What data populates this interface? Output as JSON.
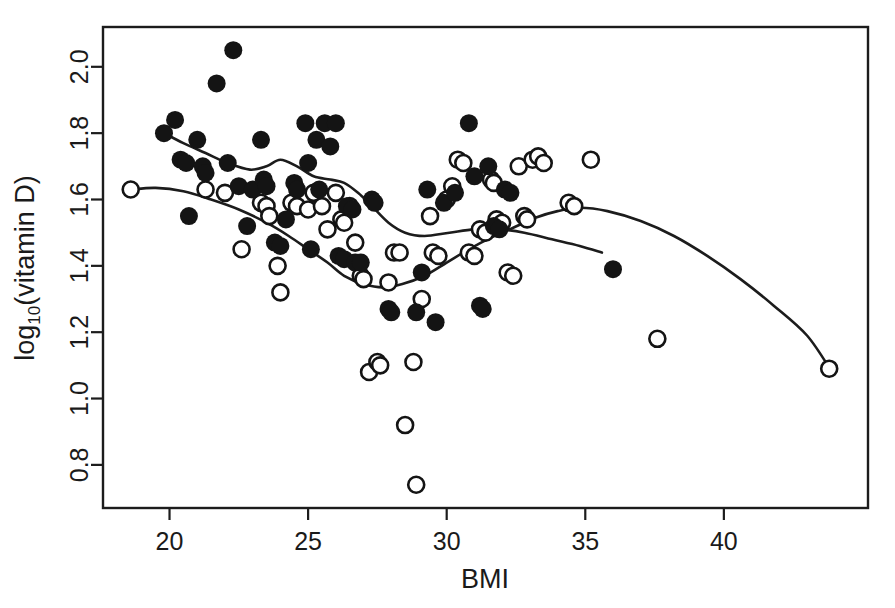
{
  "chart_data": {
    "type": "scatter",
    "title": "",
    "xlabel": "BMI",
    "ylabel": "log10(vitamin D)",
    "ylabel_main": "log",
    "ylabel_sub": "10",
    "ylabel_rest": "(vitamin D)",
    "xlim": [
      17.6,
      45.2
    ],
    "ylim": [
      0.67,
      2.12
    ],
    "xticks": [
      20,
      25,
      30,
      35,
      40
    ],
    "yticks": [
      0.8,
      1.0,
      1.2,
      1.4,
      1.6,
      1.8,
      2.0
    ],
    "xtick_labels": [
      "20",
      "25",
      "30",
      "35",
      "40"
    ],
    "ytick_labels": [
      "0.8",
      "1.0",
      "1.2",
      "1.4",
      "1.6",
      "1.8",
      "2.0"
    ],
    "grid": false,
    "legend": "none",
    "marker_colors": {
      "filled": "#141414",
      "open_stroke": "#141414",
      "open_fill": "#ffffff"
    },
    "axis_color": "#1c1c1c",
    "background": "#ffffff",
    "series": [
      {
        "name": "filled",
        "marker": "filled-circle",
        "points": [
          [
            19.8,
            1.8
          ],
          [
            20.2,
            1.84
          ],
          [
            20.4,
            1.72
          ],
          [
            20.6,
            1.71
          ],
          [
            20.7,
            1.55
          ],
          [
            21.0,
            1.78
          ],
          [
            21.2,
            1.7
          ],
          [
            21.3,
            1.68
          ],
          [
            21.7,
            1.95
          ],
          [
            22.1,
            1.71
          ],
          [
            22.3,
            2.05
          ],
          [
            22.5,
            1.64
          ],
          [
            22.8,
            1.52
          ],
          [
            23.0,
            1.63
          ],
          [
            23.3,
            1.78
          ],
          [
            23.4,
            1.66
          ],
          [
            23.5,
            1.64
          ],
          [
            23.8,
            1.47
          ],
          [
            24.0,
            1.46
          ],
          [
            24.2,
            1.54
          ],
          [
            24.5,
            1.65
          ],
          [
            24.6,
            1.63
          ],
          [
            24.9,
            1.83
          ],
          [
            25.0,
            1.71
          ],
          [
            25.1,
            1.45
          ],
          [
            25.3,
            1.78
          ],
          [
            25.4,
            1.63
          ],
          [
            25.6,
            1.83
          ],
          [
            25.8,
            1.76
          ],
          [
            26.0,
            1.83
          ],
          [
            26.1,
            1.43
          ],
          [
            26.3,
            1.42
          ],
          [
            26.4,
            1.58
          ],
          [
            26.6,
            1.57
          ],
          [
            26.7,
            1.41
          ],
          [
            26.9,
            1.41
          ],
          [
            27.3,
            1.6
          ],
          [
            27.4,
            1.59
          ],
          [
            27.9,
            1.27
          ],
          [
            28.0,
            1.26
          ],
          [
            28.9,
            1.26
          ],
          [
            29.1,
            1.38
          ],
          [
            29.3,
            1.63
          ],
          [
            29.6,
            1.23
          ],
          [
            29.9,
            1.59
          ],
          [
            30.3,
            1.62
          ],
          [
            30.8,
            1.83
          ],
          [
            31.0,
            1.67
          ],
          [
            31.2,
            1.28
          ],
          [
            31.3,
            1.27
          ],
          [
            31.5,
            1.7
          ],
          [
            31.7,
            1.52
          ],
          [
            31.9,
            1.51
          ],
          [
            32.1,
            1.63
          ],
          [
            32.3,
            1.62
          ],
          [
            36.0,
            1.39
          ]
        ]
      },
      {
        "name": "open",
        "marker": "open-circle",
        "points": [
          [
            18.6,
            1.63
          ],
          [
            21.3,
            1.63
          ],
          [
            22.0,
            1.62
          ],
          [
            22.6,
            1.45
          ],
          [
            23.3,
            1.59
          ],
          [
            23.5,
            1.58
          ],
          [
            23.6,
            1.55
          ],
          [
            23.9,
            1.4
          ],
          [
            24.0,
            1.32
          ],
          [
            24.4,
            1.59
          ],
          [
            24.6,
            1.58
          ],
          [
            25.0,
            1.57
          ],
          [
            25.2,
            1.62
          ],
          [
            25.5,
            1.58
          ],
          [
            25.7,
            1.51
          ],
          [
            26.0,
            1.62
          ],
          [
            26.2,
            1.54
          ],
          [
            26.3,
            1.53
          ],
          [
            26.5,
            1.58
          ],
          [
            26.7,
            1.47
          ],
          [
            26.9,
            1.37
          ],
          [
            27.0,
            1.36
          ],
          [
            27.2,
            1.08
          ],
          [
            27.5,
            1.11
          ],
          [
            27.6,
            1.1
          ],
          [
            27.9,
            1.35
          ],
          [
            28.1,
            1.44
          ],
          [
            28.3,
            1.44
          ],
          [
            28.5,
            0.92
          ],
          [
            28.8,
            1.11
          ],
          [
            28.9,
            0.74
          ],
          [
            29.1,
            1.3
          ],
          [
            29.4,
            1.55
          ],
          [
            29.5,
            1.44
          ],
          [
            29.7,
            1.43
          ],
          [
            30.0,
            1.6
          ],
          [
            30.2,
            1.64
          ],
          [
            30.4,
            1.72
          ],
          [
            30.6,
            1.71
          ],
          [
            30.8,
            1.44
          ],
          [
            31.0,
            1.43
          ],
          [
            31.2,
            1.51
          ],
          [
            31.4,
            1.5
          ],
          [
            31.6,
            1.66
          ],
          [
            31.7,
            1.65
          ],
          [
            31.8,
            1.54
          ],
          [
            32.0,
            1.53
          ],
          [
            32.2,
            1.38
          ],
          [
            32.4,
            1.37
          ],
          [
            32.6,
            1.7
          ],
          [
            32.8,
            1.55
          ],
          [
            32.9,
            1.54
          ],
          [
            33.1,
            1.72
          ],
          [
            33.3,
            1.73
          ],
          [
            33.5,
            1.71
          ],
          [
            34.4,
            1.59
          ],
          [
            34.6,
            1.58
          ],
          [
            35.2,
            1.72
          ],
          [
            37.6,
            1.18
          ],
          [
            43.8,
            1.09
          ]
        ]
      }
    ],
    "trend_curves": [
      {
        "name": "filled-loess",
        "description": "Lowess smoother through filled points",
        "path": [
          [
            19.8,
            1.8
          ],
          [
            20.5,
            1.77
          ],
          [
            21.3,
            1.74
          ],
          [
            22.1,
            1.71
          ],
          [
            22.9,
            1.69
          ],
          [
            23.5,
            1.7
          ],
          [
            24.0,
            1.72
          ],
          [
            24.6,
            1.7
          ],
          [
            25.2,
            1.67
          ],
          [
            25.8,
            1.66
          ],
          [
            26.3,
            1.65
          ],
          [
            26.8,
            1.62
          ],
          [
            27.3,
            1.58
          ],
          [
            27.9,
            1.53
          ],
          [
            28.5,
            1.5
          ],
          [
            29.2,
            1.49
          ],
          [
            30.1,
            1.5
          ],
          [
            31.0,
            1.51
          ],
          [
            31.9,
            1.51
          ],
          [
            32.8,
            1.5
          ],
          [
            33.8,
            1.48
          ],
          [
            34.8,
            1.46
          ],
          [
            35.6,
            1.44
          ]
        ]
      },
      {
        "name": "open-loess",
        "description": "Lowess smoother through open points",
        "path": [
          [
            18.6,
            1.63
          ],
          [
            19.5,
            1.635
          ],
          [
            20.5,
            1.625
          ],
          [
            21.5,
            1.6
          ],
          [
            22.5,
            1.57
          ],
          [
            23.5,
            1.53
          ],
          [
            24.3,
            1.49
          ],
          [
            25.0,
            1.45
          ],
          [
            25.7,
            1.41
          ],
          [
            26.3,
            1.37
          ],
          [
            27.0,
            1.345
          ],
          [
            27.7,
            1.335
          ],
          [
            28.4,
            1.345
          ],
          [
            29.2,
            1.37
          ],
          [
            30.0,
            1.41
          ],
          [
            30.8,
            1.45
          ],
          [
            31.6,
            1.485
          ],
          [
            32.4,
            1.515
          ],
          [
            33.2,
            1.545
          ],
          [
            34.0,
            1.565
          ],
          [
            34.8,
            1.575
          ],
          [
            35.8,
            1.565
          ],
          [
            37.0,
            1.535
          ],
          [
            38.2,
            1.49
          ],
          [
            39.4,
            1.43
          ],
          [
            40.6,
            1.36
          ],
          [
            41.8,
            1.28
          ],
          [
            43.0,
            1.19
          ],
          [
            43.9,
            1.08
          ]
        ]
      }
    ]
  }
}
